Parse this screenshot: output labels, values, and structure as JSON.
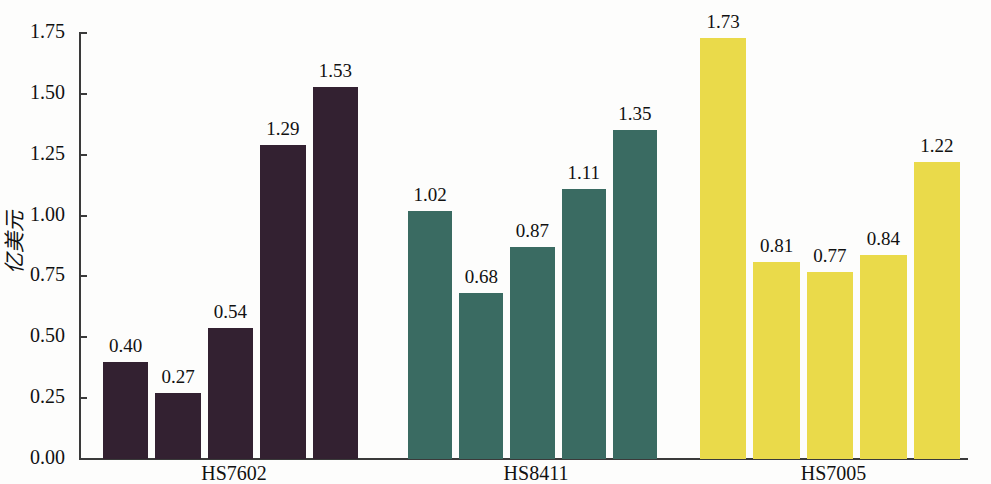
{
  "chart_data": {
    "type": "bar",
    "title": "",
    "xlabel": "",
    "ylabel": "亿美元",
    "ylim": [
      0,
      1.75
    ],
    "yticks": [
      "0.00",
      "0.25",
      "0.50",
      "0.75",
      "1.00",
      "1.25",
      "1.50",
      "1.75"
    ],
    "grid": false,
    "legend": "none",
    "categories": [
      "HS7602",
      "HS8411",
      "HS7005"
    ],
    "groups": [
      {
        "category": "HS7602",
        "color": "#332131",
        "values": [
          0.4,
          0.27,
          0.54,
          1.29,
          1.53
        ],
        "labels": [
          "0.40",
          "0.27",
          "0.54",
          "1.29",
          "1.53"
        ]
      },
      {
        "category": "HS8411",
        "color": "#3a6b62",
        "values": [
          1.02,
          0.68,
          0.87,
          1.11,
          1.35
        ],
        "labels": [
          "1.02",
          "0.68",
          "0.87",
          "1.11",
          "1.35"
        ]
      },
      {
        "category": "HS7005",
        "color": "#eada4a",
        "values": [
          1.73,
          0.81,
          0.77,
          0.84,
          1.22
        ],
        "labels": [
          "1.73",
          "0.81",
          "0.77",
          "0.84",
          "1.22"
        ]
      }
    ]
  }
}
